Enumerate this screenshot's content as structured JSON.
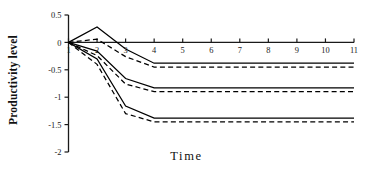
{
  "chart_data": {
    "type": "line",
    "title": "",
    "xlabel": "Time",
    "ylabel": "Productivity level",
    "x": [
      1,
      2,
      3,
      4,
      5,
      6,
      7,
      8,
      9,
      10,
      11
    ],
    "xlim": [
      1,
      11
    ],
    "ylim": [
      -2,
      0.5
    ],
    "yticks": [
      0.5,
      0,
      -0.5,
      -1,
      -1.5,
      -2
    ],
    "ytick_labels": [
      "0.5",
      "0",
      "-0.5",
      "-1",
      "-1.5",
      "-2"
    ],
    "xticks": [
      1,
      2,
      3,
      4,
      5,
      6,
      7,
      8,
      9,
      10,
      11
    ],
    "xtick_labels": [
      "1",
      "2",
      "3",
      "4",
      "5",
      "6",
      "7",
      "8",
      "9",
      "10",
      "11"
    ],
    "grid": false,
    "legend": "none",
    "axis_color": "#1a1a1a",
    "line_color": "#000000",
    "series": [
      {
        "name": "upper-solid",
        "style": "solid",
        "values": [
          0,
          0.28,
          -0.12,
          -0.38,
          -0.38,
          -0.38,
          -0.38,
          -0.38,
          -0.38,
          -0.38,
          -0.38
        ]
      },
      {
        "name": "upper-dashed",
        "style": "dashed",
        "values": [
          0,
          0.06,
          -0.26,
          -0.45,
          -0.45,
          -0.45,
          -0.45,
          -0.45,
          -0.45,
          -0.45,
          -0.45
        ]
      },
      {
        "name": "middle-solid",
        "style": "solid",
        "values": [
          0,
          -0.16,
          -0.66,
          -0.83,
          -0.83,
          -0.83,
          -0.83,
          -0.83,
          -0.83,
          -0.83,
          -0.83
        ]
      },
      {
        "name": "middle-dashed",
        "style": "dashed",
        "values": [
          0,
          -0.24,
          -0.76,
          -0.9,
          -0.9,
          -0.9,
          -0.9,
          -0.9,
          -0.9,
          -0.9,
          -0.9
        ]
      },
      {
        "name": "lower-solid",
        "style": "solid",
        "values": [
          0,
          -0.3,
          -1.16,
          -1.38,
          -1.38,
          -1.38,
          -1.38,
          -1.38,
          -1.38,
          -1.38,
          -1.38
        ]
      },
      {
        "name": "lower-dashed",
        "style": "dashed",
        "values": [
          0,
          -0.4,
          -1.3,
          -1.45,
          -1.45,
          -1.45,
          -1.45,
          -1.45,
          -1.45,
          -1.45,
          -1.45
        ]
      }
    ]
  },
  "axes": {
    "y_axis_title": "Productivity level",
    "x_axis_title": "Time"
  }
}
